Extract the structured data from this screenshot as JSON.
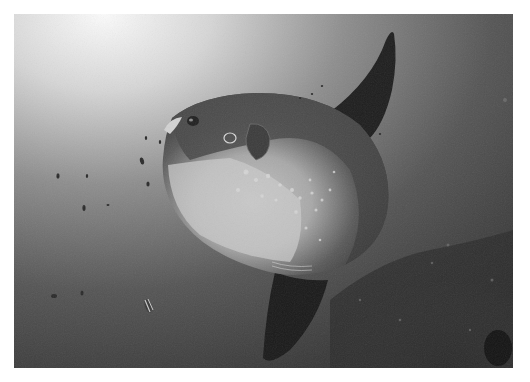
{
  "image": {
    "subject": "Ocean sunfish (Mola mola) swimming underwater",
    "style": "grayscale underwater photograph",
    "border_color": "#ffffff",
    "elements": [
      "ocean sunfish with tall dorsal fin and anal fin",
      "small dark fish specks in open water",
      "small striped fish near bottom left",
      "rocky reef in lower right"
    ]
  }
}
